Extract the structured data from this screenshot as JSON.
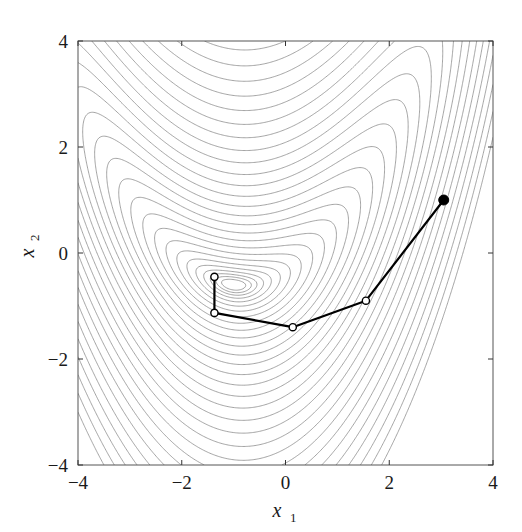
{
  "chart_data": {
    "type": "line",
    "title": "",
    "subtitle": "",
    "xlabel": "x1",
    "xlabel_base": "x",
    "xlabel_sub": "1",
    "ylabel": "x2",
    "ylabel_base": "x",
    "ylabel_sub": "2",
    "xlim": [
      -4,
      4
    ],
    "ylim": [
      -4,
      4
    ],
    "xticks": [
      -4,
      -2,
      0,
      2,
      4
    ],
    "yticks": [
      -4,
      -2,
      0,
      2,
      4
    ],
    "xtick_labels": [
      "-4",
      "-2",
      "0",
      "2",
      "4"
    ],
    "ytick_labels": [
      "-4",
      "-2",
      "0",
      "2",
      "4"
    ],
    "grid": false,
    "legend": "none",
    "background_field": {
      "description": "contour plot of a banana-shaped (Rosenbrock-like) objective function",
      "contour_color": "#7d7d7d",
      "contour_linewidth": 0.7,
      "minimum_estimate": [
        -1.0,
        -0.6
      ],
      "n_levels": 30
    },
    "series": [
      {
        "name": "optimization path",
        "color": "#000000",
        "linewidth": 2.2,
        "marker": "circle",
        "x": [
          3.05,
          1.55,
          0.14,
          -1.37,
          -1.37
        ],
        "y": [
          1.0,
          -0.9,
          -1.4,
          -1.13,
          -0.45
        ],
        "marker_styles": [
          "filled",
          "hollow",
          "hollow",
          "hollow",
          "hollow"
        ]
      }
    ]
  },
  "axes": {
    "frame_color": "#555555",
    "tick_color": "#333333"
  }
}
